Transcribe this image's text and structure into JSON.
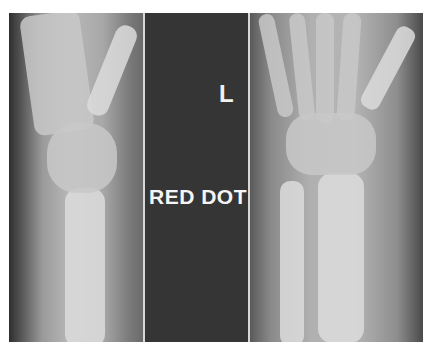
{
  "image": {
    "description": "Two radiographic views of a left wrist (lateral and PA) with a central dark divider strip bearing radiographic markers",
    "views": [
      {
        "id": "lateral",
        "label": "Lateral view of wrist"
      },
      {
        "id": "pa",
        "label": "PA view of wrist"
      }
    ],
    "markers": {
      "side": "L",
      "annotation": "RED DOT"
    }
  }
}
